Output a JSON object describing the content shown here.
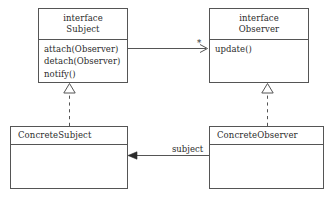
{
  "diagram": {
    "stroke_color": "#555555",
    "text_color": "#2b2b2b",
    "background": "#ffffff"
  },
  "classes": {
    "subject": {
      "stereotype": "interface",
      "name": "Subject",
      "members": [
        "attach(Observer)",
        "detach(Observer)",
        "notify()"
      ]
    },
    "observer": {
      "stereotype": "interface",
      "name": "Observer",
      "members": [
        "update()"
      ]
    },
    "concrete_subject": {
      "name": "ConcreteSubject",
      "members": []
    },
    "concrete_observer": {
      "name": "ConcreteObserver",
      "members": []
    }
  },
  "relations": {
    "subject_observes": {
      "kind": "association",
      "from": "Subject",
      "to": "Observer",
      "multiplicity_label": "*",
      "arrowhead": "open"
    },
    "observer_subject_ref": {
      "kind": "association",
      "from": "ConcreteObserver",
      "to": "ConcreteSubject",
      "role_label": "subject",
      "arrowhead": "filled"
    },
    "concrete_subject_realizes": {
      "kind": "realization",
      "from": "ConcreteSubject",
      "to": "Subject",
      "line": "dashed",
      "arrowhead": "hollow-triangle"
    },
    "concrete_observer_realizes": {
      "kind": "realization",
      "from": "ConcreteObserver",
      "to": "Observer",
      "line": "dashed",
      "arrowhead": "hollow-triangle"
    }
  }
}
